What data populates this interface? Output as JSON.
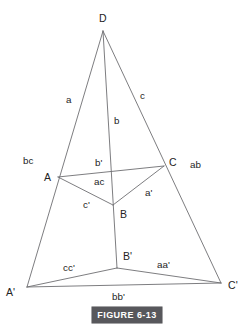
{
  "figure": {
    "caption": "FIGURE 6-13",
    "caption_background_color": "#58585c",
    "caption_text_color": "#ffffff",
    "line_color": "#6e6e72",
    "background_color": "#ffffff",
    "text_color": "#232323"
  },
  "vertices": [
    {
      "key": "D",
      "label": "D",
      "x": 103,
      "y": 31,
      "label_x": 99,
      "label_y": 13
    },
    {
      "key": "A",
      "label": "A",
      "x": 58,
      "y": 177,
      "label_x": 44,
      "label_y": 172
    },
    {
      "key": "B",
      "label": "B",
      "x": 113,
      "y": 205,
      "label_x": 120,
      "label_y": 209
    },
    {
      "key": "C",
      "label": "C",
      "x": 164,
      "y": 166,
      "label_x": 169,
      "label_y": 157
    },
    {
      "key": "Ap",
      "label": "A'",
      "x": 27,
      "y": 287,
      "label_x": 6,
      "label_y": 287
    },
    {
      "key": "Bp",
      "label": "B'",
      "x": 117,
      "y": 268,
      "label_x": 123,
      "label_y": 251
    },
    {
      "key": "Cp",
      "label": "C'",
      "x": 221,
      "y": 283,
      "label_x": 228,
      "label_y": 280
    }
  ],
  "edges": [
    {
      "name": "D-Aprime",
      "from": "D",
      "to": "Ap",
      "d": "M 103 31 L 27 287"
    },
    {
      "name": "D-Bprime",
      "from": "D",
      "to": "Bp",
      "d": "M 103 31 L 117 268"
    },
    {
      "name": "D-Cprime",
      "from": "D",
      "to": "Cp",
      "d": "M 103 31 L 221 283"
    },
    {
      "name": "A-C",
      "from": "A",
      "to": "C",
      "d": "M 58 177 L 164 166"
    },
    {
      "name": "A-B",
      "from": "A",
      "to": "B",
      "d": "M 58 177 L 113 205"
    },
    {
      "name": "B-C",
      "from": "B",
      "to": "C",
      "d": "M 113 205 L 164 166"
    },
    {
      "name": "Aprime-Bprime",
      "from": "Ap",
      "to": "Bp",
      "d": "M 27 287 L 117 268"
    },
    {
      "name": "Bprime-Cprime",
      "from": "Bp",
      "to": "Cp",
      "d": "M 117 268 L 221 283"
    },
    {
      "name": "Aprime-Cprime",
      "from": "Ap",
      "to": "Cp",
      "d": "M 27 287 L 221 283"
    }
  ],
  "edge_labels": [
    {
      "key": "a",
      "label": "a",
      "x": 66,
      "y": 95,
      "edge": "D-Aprime"
    },
    {
      "key": "c",
      "label": "c",
      "x": 140,
      "y": 91,
      "edge": "D-Cprime"
    },
    {
      "key": "b",
      "label": "b",
      "x": 114,
      "y": 116,
      "edge": "D-Bprime"
    },
    {
      "key": "bc",
      "label": "bc",
      "x": 23,
      "y": 156,
      "edge": "face-left-upper"
    },
    {
      "key": "ab",
      "label": "ab",
      "x": 190,
      "y": 160,
      "edge": "face-right-upper"
    },
    {
      "key": "bp",
      "label": "b'",
      "x": 95,
      "y": 158,
      "edge": "A-C"
    },
    {
      "key": "ac",
      "label": "ac",
      "x": 94,
      "y": 177,
      "edge": "face-ABC"
    },
    {
      "key": "ap",
      "label": "a'",
      "x": 145,
      "y": 188,
      "edge": "B-C"
    },
    {
      "key": "cp",
      "label": "c'",
      "x": 83,
      "y": 200,
      "edge": "A-B"
    },
    {
      "key": "ccp",
      "label": "cc'",
      "x": 63,
      "y": 263,
      "edge": "face-left-lower"
    },
    {
      "key": "aap",
      "label": "aa'",
      "x": 157,
      "y": 260,
      "edge": "face-right-lower"
    },
    {
      "key": "bbp",
      "label": "bb'",
      "x": 112,
      "y": 292,
      "edge": "Aprime-Cprime"
    }
  ]
}
